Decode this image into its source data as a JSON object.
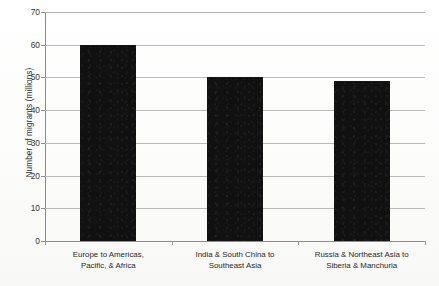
{
  "chart_data": {
    "type": "bar",
    "title": "",
    "xlabel": "",
    "ylabel": "Number of migrants (millions)",
    "categories": [
      "Europe to Americas, Pacific, & Africa",
      "India & South China to Southeast Asia",
      "Russia & Northeast Asia to Siberia & Manchuria"
    ],
    "category_lines": [
      [
        "Europe to Americas,",
        "Pacific, & Africa"
      ],
      [
        "India & South China to",
        "Southeast Asia"
      ],
      [
        "Russia & Northeast Asia to",
        "Siberia & Manchuria"
      ]
    ],
    "values": [
      60,
      50,
      49
    ],
    "ylim": [
      0,
      70
    ],
    "ytick_labels": [
      "70",
      "60",
      "50",
      "40",
      "30",
      "20",
      "10",
      "0"
    ],
    "ytick_values": [
      70,
      60,
      50,
      40,
      30,
      20,
      10,
      0
    ],
    "grid": true,
    "legend": false,
    "bar_color": "#111111",
    "grid_color": "#b9b9b9",
    "axis_color": "#8b8b8b",
    "background": "#fdfdfd"
  },
  "figure": {
    "bottom_caption": ""
  }
}
